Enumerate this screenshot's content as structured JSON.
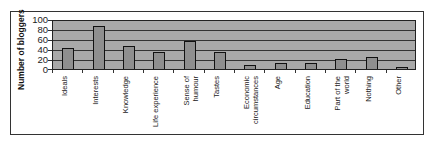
{
  "chart_data": {
    "type": "bar",
    "title": "",
    "xlabel": "",
    "ylabel": "Number of bloggers",
    "ylim": [
      0,
      100
    ],
    "yticks": [
      0,
      20,
      40,
      60,
      80,
      100
    ],
    "grid": true,
    "legend": null,
    "categories": [
      "Ideals",
      "Interests",
      "Knowledge",
      "Life experience",
      "Sense of humour",
      "Tastes",
      "Economic circumstances",
      "Age",
      "Education",
      "Part of the world",
      "Nothing",
      "Other"
    ],
    "values": [
      43,
      90,
      48,
      35,
      58,
      35,
      9,
      13,
      13,
      20,
      25,
      5
    ]
  },
  "labels": {
    "ylabel": "Number of bloggers",
    "yticks": [
      "0",
      "20",
      "40",
      "60",
      "80",
      "100"
    ],
    "categories": [
      "Ideals",
      "Interests",
      "Knowledge",
      "Life experience",
      "Sense of humour",
      "Tastes",
      "Economic circumstances",
      "Age",
      "Education",
      "Part of the world",
      "Nothing",
      "Other"
    ]
  }
}
